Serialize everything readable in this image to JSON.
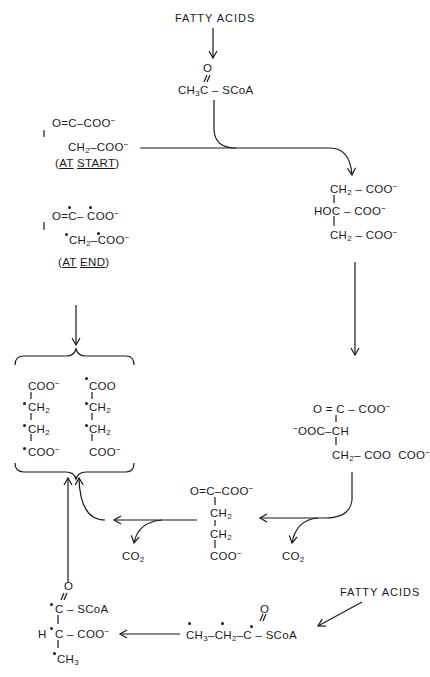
{
  "diagram": {
    "top_source": "FATTY ACIDS",
    "acetyl_coa": {
      "left": "CH",
      "sub": "3",
      "c": "C",
      "right": "– SCoA",
      "o": "O"
    },
    "oxaloacetate_start": {
      "line1": "O=C–COO",
      "line2": "CH",
      "line2_sub": "2",
      "line2_rest": "–COO",
      "charge": "−",
      "note_open": "(",
      "note_at": "AT",
      "note_word": "START",
      "note_close": ")"
    },
    "oxaloacetate_end": {
      "line1": "O=C– COO",
      "line2": "CH",
      "line2_sub": "2",
      "line2_rest": "–COO",
      "charge": "−",
      "note_open": "(",
      "note_at": "AT",
      "note_word": "END",
      "note_close": ")"
    },
    "citrate": {
      "line1": "CH",
      "line1_sub": "2",
      "line1_rest": " – COO",
      "line2": "HOC – COO",
      "line3": "CH",
      "line3_sub": "2",
      "line3_rest": " – COO",
      "charge": "−"
    },
    "oxalosuccinate": {
      "line1": "O = C – COO",
      "line2_pre": "OOC–CH",
      "line3": "CH",
      "line3_sub": "2",
      "line3_rest": "– COO",
      "charge": "−"
    },
    "alpha_ketoglutarate": {
      "line1": "O=C–COO",
      "line2": "CH",
      "line3": "CH",
      "sub": "2",
      "line4": "COO",
      "charge": "−"
    },
    "succinate_left": {
      "c1": "COO",
      "c2": "CH",
      "c3": "CH",
      "c4": "COO",
      "sub": "2",
      "charge": "−"
    },
    "succinate_right": {
      "c1": "COO",
      "c2": "CH",
      "c3": "CH",
      "c4": "COO",
      "sub": "2",
      "charge": "−"
    },
    "co2_1": {
      "text": "CO",
      "sub": "2"
    },
    "co2_2": {
      "text": "CO",
      "sub": "2"
    },
    "propionyl_coa": {
      "p1": "CH",
      "p1_sub": "3",
      "p2": "–CH",
      "p2_sub": "2",
      "p3": "–C",
      "p4": "– SCoA",
      "o": "O"
    },
    "methylmalonyl_coa": {
      "l1": "C – SCoA",
      "l2_h": "H",
      "l2": "C – COO",
      "l3": "CH",
      "l3_sub": "3",
      "o": "O",
      "charge": "−"
    },
    "bottom_source": "FATTY ACIDS"
  }
}
